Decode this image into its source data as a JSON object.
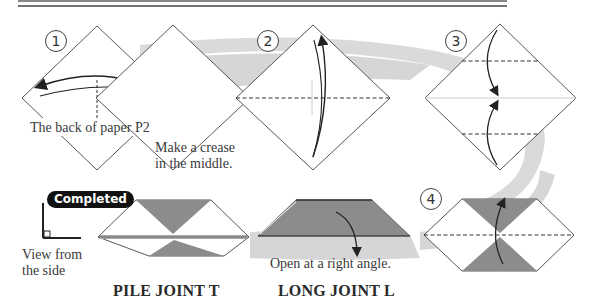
{
  "steps": [
    {
      "number": "1",
      "caption": "The back of paper P2"
    },
    {
      "number": "2",
      "caption": "Make a crease in the middle.",
      "caption_lines": [
        "Make a crease",
        "in the middle."
      ]
    },
    {
      "number": "3"
    },
    {
      "number": "4"
    }
  ],
  "completed": {
    "badge": "Completed",
    "side_view_label_lines": [
      "View from",
      "the side"
    ]
  },
  "long_joint": {
    "instruction": "Open at a right angle.",
    "title": "LONG JOINT L"
  },
  "pile_joint": {
    "title": "PILE JOINT T"
  },
  "colors": {
    "paper_fill": "#ffffff",
    "shaded_fill": "#8c8c8c",
    "flow_band": "#d6d6d6",
    "line": "#333333"
  }
}
